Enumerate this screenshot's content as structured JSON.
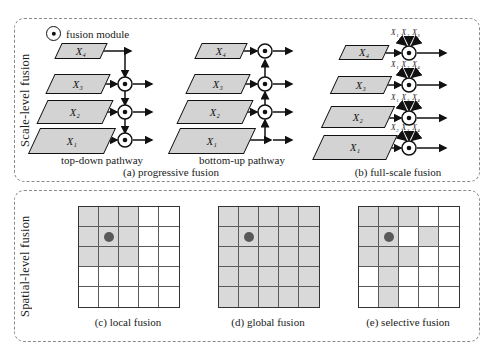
{
  "figure": {
    "legend": {
      "icon": "fusion-module-icon",
      "label": "fusion module"
    },
    "rows": [
      {
        "id": "scale",
        "vertical_label": "Scale-level fusion"
      },
      {
        "id": "spatial",
        "vertical_label": "Spatial-level fusion"
      }
    ]
  },
  "scale_level": {
    "subpanels": [
      {
        "id": "a",
        "caption": "(a) progressive fusion",
        "pathways": [
          {
            "name": "top-down pathway",
            "label": "top-down pathway"
          },
          {
            "name": "bottom-up pathway",
            "label": "bottom-up pathway"
          }
        ],
        "features": [
          "X₄",
          "X₃",
          "X₂",
          "X₁"
        ]
      },
      {
        "id": "b",
        "caption": "(b) full-scale fusion",
        "features": [
          "X₄",
          "X₃",
          "X₂",
          "X₁"
        ],
        "inputs": [
          {
            "target": "X₄",
            "sources": "X₁ X₂ X₃"
          },
          {
            "target": "X₃",
            "sources": "X₁ X₂ X₄"
          },
          {
            "target": "X₂",
            "sources": "X₁ X₃ X₄"
          },
          {
            "target": "X₁",
            "sources": "X₂ X₃ X₄"
          }
        ]
      }
    ]
  },
  "spatial_level": {
    "grid_size": 5,
    "subpanels": [
      {
        "id": "c",
        "caption": "(c) local fusion",
        "dot": {
          "row": 1,
          "col": 1
        },
        "active": [
          [
            1,
            1,
            1,
            0,
            0
          ],
          [
            1,
            1,
            1,
            0,
            0
          ],
          [
            1,
            1,
            1,
            0,
            0
          ],
          [
            0,
            0,
            0,
            0,
            0
          ],
          [
            0,
            0,
            0,
            0,
            0
          ]
        ]
      },
      {
        "id": "d",
        "caption": "(d) global fusion",
        "dot": {
          "row": 1,
          "col": 1
        },
        "active": [
          [
            1,
            1,
            1,
            1,
            1
          ],
          [
            1,
            1,
            1,
            1,
            1
          ],
          [
            1,
            1,
            1,
            1,
            1
          ],
          [
            1,
            1,
            1,
            1,
            1
          ],
          [
            1,
            1,
            1,
            1,
            1
          ]
        ]
      },
      {
        "id": "e",
        "caption": "(e) selective fusion",
        "dot": {
          "row": 1,
          "col": 1
        },
        "active": [
          [
            1,
            1,
            1,
            0,
            0
          ],
          [
            1,
            1,
            0,
            1,
            0
          ],
          [
            1,
            1,
            1,
            0,
            0
          ],
          [
            0,
            1,
            0,
            0,
            0
          ],
          [
            0,
            1,
            0,
            0,
            0
          ]
        ]
      }
    ]
  },
  "colors": {
    "feature_fill": "#d3d3d3",
    "grid_active": "#d9d9d9",
    "dot": "#595959",
    "stroke": "#111111",
    "panel_border": "#8a8a8a"
  }
}
